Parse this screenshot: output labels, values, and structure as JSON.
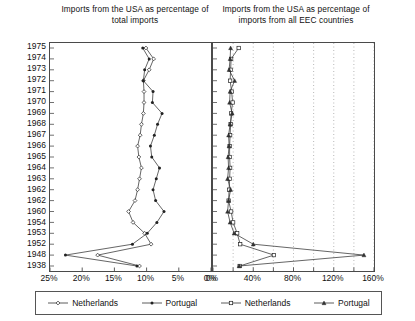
{
  "chart_data": {
    "type": "line",
    "orientation": "horizontal-year-axis",
    "categories": [
      "1975",
      "1974",
      "1973",
      "1972",
      "1971",
      "1970",
      "1969",
      "1968",
      "1967",
      "1966",
      "1965",
      "1964",
      "1963",
      "1962",
      "1962",
      "1960",
      "1954",
      "1953",
      "1952",
      "1948",
      "1938"
    ],
    "panels": [
      {
        "id": "left",
        "title": "Imports from the USA as percentage of total imports",
        "xlabel": "",
        "ylabel": "",
        "xlim": [
          25,
          0
        ],
        "reversed": true,
        "grid": false,
        "ticks": [
          25,
          20,
          15,
          10,
          5,
          0
        ],
        "ticklabels": [
          "25%",
          "20%",
          "15%",
          "10%",
          "5%",
          "0%"
        ],
        "series": [
          {
            "name": "Netherlands",
            "marker": "diamond",
            "values": [
              10.1,
              8.9,
              9.6,
              10.5,
              10.4,
              10.4,
              10.5,
              10.8,
              11.0,
              11.4,
              11.2,
              10.8,
              11.1,
              11.4,
              11.8,
              12.8,
              12.1,
              10.3,
              9.3,
              17.6,
              11.1
            ]
          },
          {
            "name": "Portugal",
            "marker": "dot",
            "values": [
              10.6,
              9.6,
              10.3,
              10.5,
              9.0,
              9.1,
              7.6,
              8.3,
              8.8,
              9.4,
              9.2,
              8.0,
              8.5,
              9.0,
              8.6,
              7.3,
              8.4,
              9.9,
              12.2,
              22.6,
              11.5
            ]
          }
        ]
      },
      {
        "id": "right",
        "title": "Imports from the USA as percentage of imports from all EEC countries",
        "xlabel": "",
        "ylabel": "",
        "xlim": [
          0,
          160
        ],
        "reversed": false,
        "grid": true,
        "gridstyle": "dotted",
        "ticks": [
          0,
          20,
          40,
          60,
          80,
          100,
          120,
          140,
          160
        ],
        "ticklabels": [
          "0%",
          "",
          "40%",
          "",
          "80%",
          "",
          "120%",
          "",
          "160%"
        ],
        "series": [
          {
            "name": "Netherlands",
            "marker": "square",
            "values": [
              25.5,
              18.0,
              17.5,
              17.0,
              18.5,
              19.5,
              18.0,
              17.5,
              17.0,
              16.5,
              16.5,
              17.0,
              16.5,
              16.0,
              15.5,
              18.0,
              20.0,
              24.0,
              27.0,
              60.5,
              26.5
            ]
          },
          {
            "name": "Portugal",
            "marker": "triangle",
            "values": [
              17.5,
              17.0,
              16.0,
              21.5,
              17.0,
              16.5,
              19.0,
              17.0,
              15.5,
              16.0,
              15.0,
              15.5,
              14.5,
              17.5,
              15.5,
              14.5,
              17.0,
              21.0,
              40.0,
              150.0,
              26.0
            ]
          }
        ]
      }
    ]
  },
  "titles": {
    "left": "Imports from the USA as percentage of total imports",
    "right": "Imports from the USA as percentage of imports from all EEC countries"
  },
  "legend": {
    "items": [
      {
        "label": "Netherlands",
        "marker": "diamond"
      },
      {
        "label": "Portugal",
        "marker": "dot"
      },
      {
        "label": "Netherlands",
        "marker": "square"
      },
      {
        "label": "Portugal",
        "marker": "triangle"
      }
    ]
  }
}
